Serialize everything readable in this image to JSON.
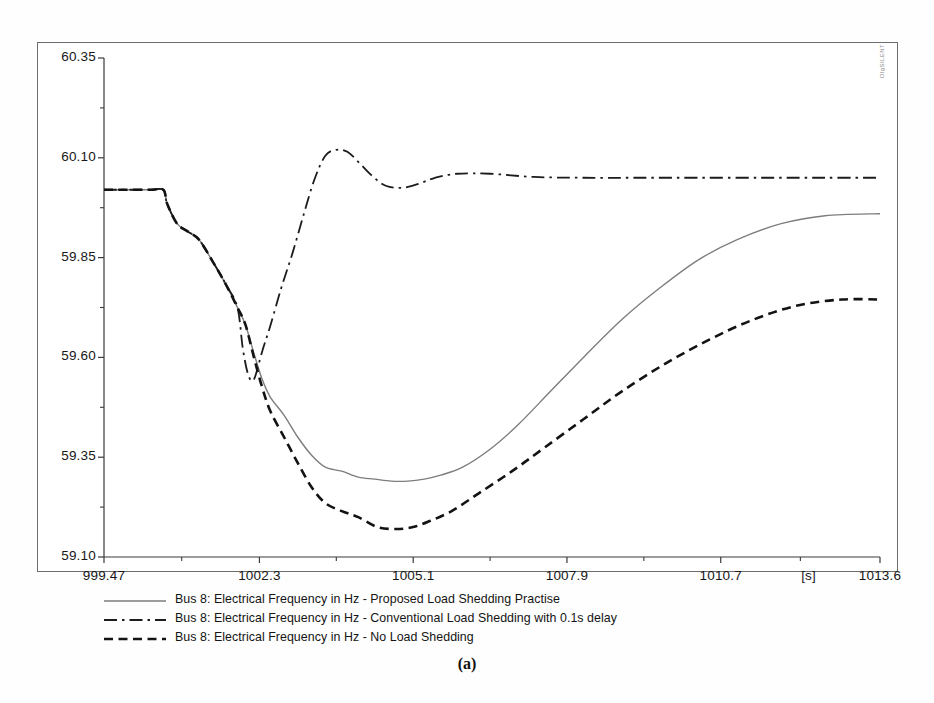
{
  "figure": {
    "caption": "(a)",
    "watermark": "DIgSILENT"
  },
  "chart_data": {
    "type": "line",
    "title": "",
    "xlabel": "[s]",
    "ylabel": "",
    "xlim": [
      999.47,
      1013.6
    ],
    "ylim": [
      59.1,
      60.35
    ],
    "grid": false,
    "legend_position": "below",
    "x_unit_label": "[s]",
    "xticks": [
      "999.47",
      "1002.3",
      "1005.1",
      "1007.9",
      "1010.7",
      "1013.6"
    ],
    "xtick_values": [
      999.47,
      1002.3,
      1005.1,
      1007.9,
      1010.7,
      1013.6
    ],
    "yticks": [
      "60.35",
      "60.10",
      "59.85",
      "59.60",
      "59.35",
      "59.10"
    ],
    "ytick_values": [
      60.35,
      60.1,
      59.85,
      59.6,
      59.35,
      59.1
    ],
    "series": [
      {
        "name": "Bus 8: Electrical Frequency in Hz - Proposed Load Shedding Practise",
        "style": "solid",
        "color": "#7d7d7d",
        "width": 1.4,
        "x": [
          999.47,
          1000.3,
          1000.55,
          1000.62,
          1000.8,
          1001.0,
          1001.2,
          1001.45,
          1001.7,
          1001.9,
          1002.05,
          1002.2,
          1002.35,
          1002.5,
          1002.75,
          1003.0,
          1003.25,
          1003.5,
          1003.8,
          1004.1,
          1004.4,
          1004.7,
          1005.0,
          1005.3,
          1005.6,
          1006.0,
          1006.5,
          1007.0,
          1007.6,
          1008.2,
          1008.9,
          1009.6,
          1010.3,
          1011.0,
          1011.8,
          1012.6,
          1013.6
        ],
        "y": [
          60.02,
          60.02,
          60.02,
          59.985,
          59.935,
          59.915,
          59.895,
          59.84,
          59.78,
          59.725,
          59.68,
          59.61,
          59.545,
          59.5,
          59.455,
          59.4,
          59.355,
          59.325,
          59.315,
          59.3,
          59.295,
          59.29,
          59.29,
          59.295,
          59.305,
          59.325,
          59.37,
          59.43,
          59.515,
          59.6,
          59.695,
          59.775,
          59.845,
          59.895,
          59.935,
          59.955,
          59.96
        ]
      },
      {
        "name": "Bus 8: Electrical Frequency in Hz - Conventional Load Shedding with 0.1s delay",
        "style": "dashdot",
        "color": "#1c1c1c",
        "width": 1.8,
        "x": [
          999.47,
          1000.3,
          1000.55,
          1000.62,
          1000.8,
          1001.0,
          1001.2,
          1001.45,
          1001.7,
          1001.9,
          1002.0,
          1002.1,
          1002.2,
          1002.35,
          1002.5,
          1002.7,
          1002.9,
          1003.1,
          1003.3,
          1003.5,
          1003.7,
          1003.9,
          1004.1,
          1004.35,
          1004.6,
          1004.9,
          1005.2,
          1005.5,
          1005.9,
          1006.5,
          1007.3,
          1008.2,
          1009.2,
          1010.3,
          1011.5,
          1012.6,
          1013.6
        ],
        "y": [
          60.02,
          60.02,
          60.02,
          59.985,
          59.935,
          59.915,
          59.895,
          59.84,
          59.78,
          59.725,
          59.62,
          59.555,
          59.545,
          59.615,
          59.68,
          59.775,
          59.86,
          59.955,
          60.045,
          60.105,
          60.12,
          60.115,
          60.09,
          60.055,
          60.03,
          60.025,
          60.035,
          60.05,
          60.06,
          60.06,
          60.052,
          60.05,
          60.05,
          60.05,
          60.05,
          60.05,
          60.05
        ]
      },
      {
        "name": "Bus 8: Electrical Frequency in Hz - No Load Shedding",
        "style": "dashed",
        "color": "#131313",
        "width": 2.6,
        "x": [
          999.47,
          1000.3,
          1000.55,
          1000.62,
          1000.8,
          1001.0,
          1001.2,
          1001.45,
          1001.7,
          1001.9,
          1002.05,
          1002.2,
          1002.35,
          1002.5,
          1002.75,
          1003.0,
          1003.25,
          1003.5,
          1003.8,
          1004.1,
          1004.45,
          1004.8,
          1005.1,
          1005.4,
          1005.8,
          1006.3,
          1006.9,
          1007.5,
          1008.2,
          1008.9,
          1009.7,
          1010.5,
          1011.3,
          1012.1,
          1012.9,
          1013.6
        ],
        "y": [
          60.02,
          60.02,
          60.02,
          59.985,
          59.935,
          59.915,
          59.895,
          59.84,
          59.78,
          59.725,
          59.68,
          59.6,
          59.525,
          59.465,
          59.4,
          59.335,
          59.275,
          59.235,
          59.215,
          59.2,
          59.175,
          59.17,
          59.175,
          59.19,
          59.215,
          59.26,
          59.315,
          59.375,
          59.445,
          59.515,
          59.585,
          59.645,
          59.695,
          59.73,
          59.745,
          59.745
        ]
      }
    ]
  },
  "legend": {
    "items": [
      {
        "label": "Bus 8: Electrical Frequency in Hz - Proposed Load Shedding Practise",
        "style": "solid"
      },
      {
        "label": "Bus 8: Electrical Frequency in Hz - Conventional Load Shedding with 0.1s delay",
        "style": "dashdot"
      },
      {
        "label": "Bus 8: Electrical Frequency in Hz - No Load Shedding",
        "style": "dashed"
      }
    ]
  }
}
